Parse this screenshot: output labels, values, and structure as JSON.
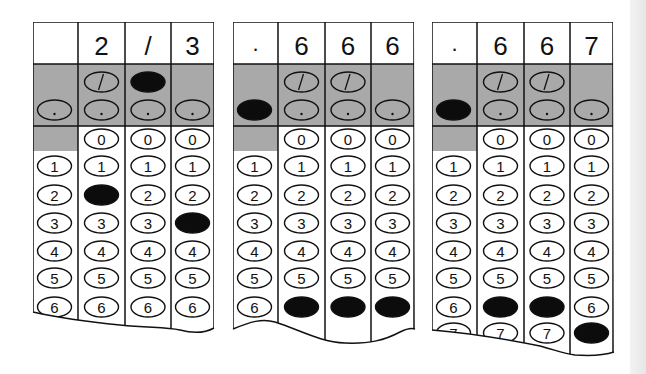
{
  "colors": {
    "ink": "#111111",
    "shade": "#a9a9a9",
    "filled": "#0c0c0c",
    "paper": "#ffffff"
  },
  "row_labels": [
    "/",
    ".",
    "0",
    "1",
    "2",
    "3",
    "4",
    "5",
    "6",
    "7"
  ],
  "grids": [
    {
      "id": "grid-2-3",
      "answer": "2/3",
      "header": [
        "",
        "2",
        "/",
        "3"
      ],
      "filled": [
        null,
        "2",
        "/",
        "3"
      ],
      "visible_rows_max": 6
    },
    {
      "id": "grid-666",
      "answer": ".666",
      "header": [
        ".",
        "6",
        "6",
        "6"
      ],
      "filled": [
        ".",
        "6",
        "6",
        "6"
      ],
      "visible_rows_max": 6
    },
    {
      "id": "grid-667",
      "answer": ".667",
      "header": [
        ".",
        "6",
        "6",
        "7"
      ],
      "filled": [
        ".",
        "6",
        "6",
        "7"
      ],
      "visible_rows_max": 7
    }
  ]
}
